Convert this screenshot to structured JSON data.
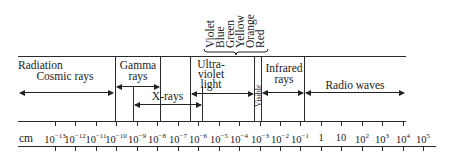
{
  "diagram": {
    "row_label": "Radiation",
    "unit_label": "cm",
    "visible_colors": [
      "Violet",
      "Blue",
      "Green",
      "Yellow",
      "Orange",
      "Red"
    ],
    "regions": [
      {
        "name": "Cosmic rays",
        "lines": [
          "Cosmic rays"
        ]
      },
      {
        "name": "Gamma rays",
        "lines": [
          "Gamma",
          "rays"
        ]
      },
      {
        "name": "X-rays",
        "lines": [
          "X-rays"
        ]
      },
      {
        "name": "Ultraviolet light",
        "lines": [
          "Ultra-",
          "violet",
          "light"
        ]
      },
      {
        "name": "Visible",
        "lines": [
          "Visible"
        ]
      },
      {
        "name": "Infrared rays",
        "lines": [
          "Infrared",
          "rays"
        ]
      },
      {
        "name": "Radio waves",
        "lines": [
          "Radio waves"
        ]
      }
    ],
    "axis_ticks": [
      {
        "base": "10",
        "exp": "−13"
      },
      {
        "base": "10",
        "exp": "−12"
      },
      {
        "base": "10",
        "exp": "−11"
      },
      {
        "base": "10",
        "exp": "−10"
      },
      {
        "base": "10",
        "exp": "−9"
      },
      {
        "base": "10",
        "exp": "−8"
      },
      {
        "base": "10",
        "exp": "−7"
      },
      {
        "base": "10",
        "exp": "−6"
      },
      {
        "base": "10",
        "exp": "−5"
      },
      {
        "base": "10",
        "exp": "−4"
      },
      {
        "base": "10",
        "exp": "−3"
      },
      {
        "base": "10",
        "exp": "−2"
      },
      {
        "base": "10",
        "exp": "−1"
      },
      {
        "base": "1",
        "exp": ""
      },
      {
        "base": "10",
        "exp": ""
      },
      {
        "base": "10",
        "exp": "2"
      },
      {
        "base": "10",
        "exp": "3"
      },
      {
        "base": "10",
        "exp": "4"
      },
      {
        "base": "10",
        "exp": "5"
      }
    ]
  }
}
